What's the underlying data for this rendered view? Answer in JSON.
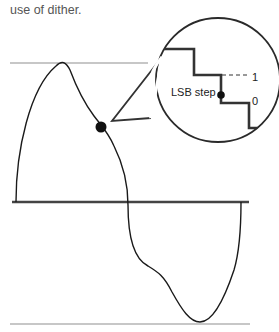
{
  "caption": "use of dither.",
  "diagram": {
    "type": "waveform-with-magnified-callout",
    "labels": {
      "lsb_step": "LSB step",
      "level_upper": "1",
      "level_lower": "0"
    },
    "colors": {
      "waveform": "#1a1a1a",
      "baseline": "#444444",
      "clip_lines": "#b5b5b5",
      "staircase": "#333333",
      "circle": "#2a2a2a",
      "caption": "#555555"
    }
  }
}
